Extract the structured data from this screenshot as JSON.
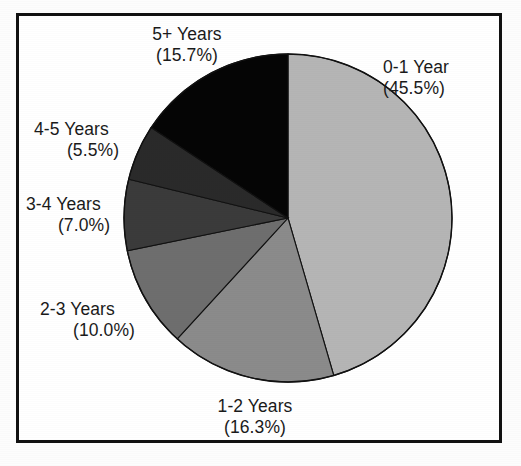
{
  "chart_data": {
    "type": "pie",
    "title": "",
    "subtitle": "",
    "xlabel": "",
    "ylabel": "",
    "legend_position": "none",
    "grid": false,
    "start_angle_deg": 0,
    "direction": "clockwise",
    "categories": [
      "0-1 Year",
      "1-2 Years",
      "2-3 Years",
      "3-4 Years",
      "4-5 Years",
      "5+ Years"
    ],
    "values": [
      45.5,
      16.3,
      10.0,
      7.0,
      5.5,
      15.7
    ],
    "value_unit": "%",
    "colors": [
      "#b5b5b5",
      "#8b8b8b",
      "#6e6e6e",
      "#3b3b3b",
      "#2a2a2a",
      "#050505"
    ],
    "slices": [
      {
        "label": "0-1 Year",
        "percent_text": "(45.5%)",
        "value": 45.5,
        "color": "#b5b5b5"
      },
      {
        "label": "1-2 Years",
        "percent_text": "(16.3%)",
        "value": 16.3,
        "color": "#8b8b8b"
      },
      {
        "label": "2-3 Years",
        "percent_text": "(10.0%)",
        "value": 10.0,
        "color": "#6e6e6e"
      },
      {
        "label": "3-4 Years",
        "percent_text": "(7.0%)",
        "value": 7.0,
        "color": "#3b3b3b"
      },
      {
        "label": "4-5 Years",
        "percent_text": "(5.5%)",
        "value": 5.5,
        "color": "#2a2a2a"
      },
      {
        "label": "5+ Years",
        "percent_text": "(15.7%)",
        "value": 15.7,
        "color": "#050505"
      }
    ]
  },
  "figure": {
    "border_color": "#111111",
    "background": "#ffffff"
  }
}
